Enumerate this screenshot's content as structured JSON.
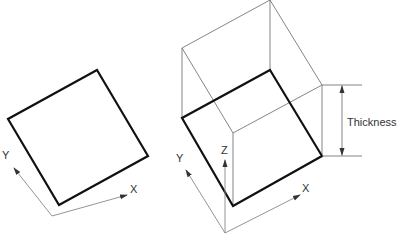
{
  "left_figure": {
    "axis_labels": {
      "x": "X",
      "y": "Y"
    }
  },
  "right_figure": {
    "axis_labels": {
      "x": "X",
      "y": "Y",
      "z": "Z"
    },
    "dimension_label": "Thickness"
  },
  "colors": {
    "outline": "#111111",
    "thin_line": "#777777",
    "text": "#333333"
  }
}
